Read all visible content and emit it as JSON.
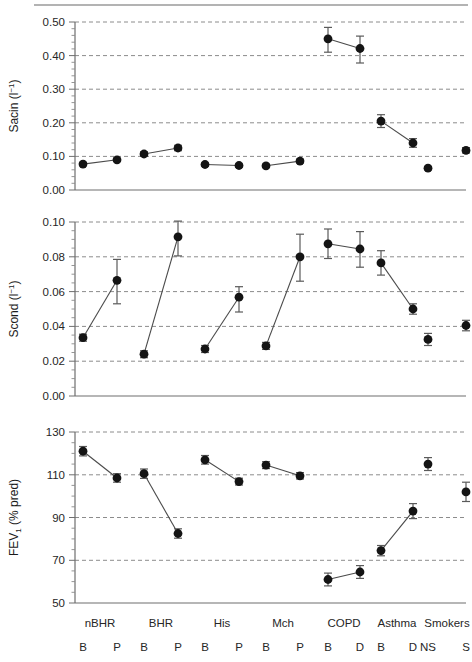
{
  "figure": {
    "background": "#ffffff",
    "marker_color": "#141414",
    "grid_color": "#8c8c8c",
    "axis_color": "#6e6e6e"
  },
  "groups": [
    {
      "label": "nBHR",
      "sub": [
        "B",
        "P"
      ],
      "connected": true
    },
    {
      "label": "BHR",
      "sub": [
        "B",
        "P"
      ],
      "connected": true
    },
    {
      "label": "His",
      "sub": [
        "B",
        "P"
      ],
      "connected": true
    },
    {
      "label": "Mch",
      "sub": [
        "B",
        "P"
      ],
      "connected": true
    },
    {
      "label": "COPD",
      "sub": [
        "B",
        "D"
      ],
      "connected": true
    },
    {
      "label": "Asthma",
      "sub": [
        "B",
        "D"
      ],
      "connected": true
    },
    {
      "label": "Smokers",
      "sub": [
        "NS",
        "S"
      ],
      "connected": false
    }
  ],
  "chart_data": [
    {
      "type": "scatter",
      "panel": "top",
      "title": "",
      "ylabel": "Sacin (l−1)",
      "xlabel": "",
      "ylim": [
        0.0,
        0.5
      ],
      "yticks": [
        0.0,
        0.1,
        0.2,
        0.3,
        0.4,
        0.5
      ],
      "ytick_labels": [
        "0.00",
        "0.10",
        "0.20",
        "0.30",
        "0.40",
        "0.50"
      ],
      "minor_tick_step": 0.02,
      "grid": true,
      "legend": "none",
      "categories": [
        "nBHR B",
        "nBHR P",
        "BHR B",
        "BHR P",
        "His B",
        "His P",
        "Mch B",
        "Mch P",
        "COPD B",
        "COPD D",
        "Asthma B",
        "Asthma D",
        "Smokers NS",
        "Smokers S"
      ],
      "values": [
        0.077,
        0.09,
        0.107,
        0.125,
        0.076,
        0.073,
        0.072,
        0.086,
        0.45,
        0.421,
        0.205,
        0.14,
        0.065,
        0.118
      ],
      "err_low": [
        0.005,
        0.005,
        0.007,
        0.008,
        0.005,
        0.005,
        0.005,
        0.006,
        0.04,
        0.043,
        0.019,
        0.013,
        0.005,
        0.008
      ],
      "err_high": [
        0.005,
        0.005,
        0.007,
        0.008,
        0.005,
        0.005,
        0.005,
        0.006,
        0.034,
        0.037,
        0.019,
        0.013,
        0.005,
        0.008
      ]
    },
    {
      "type": "scatter",
      "panel": "middle",
      "title": "",
      "ylabel": "Scond (l−1)",
      "xlabel": "",
      "ylim": [
        0.0,
        0.1
      ],
      "yticks": [
        0.0,
        0.02,
        0.04,
        0.06,
        0.08,
        0.1
      ],
      "ytick_labels": [
        "0.00",
        "0.02",
        "0.04",
        "0.06",
        "0.08",
        "0.10"
      ],
      "minor_tick_step": 0.005,
      "grid": true,
      "legend": "none",
      "categories": [
        "nBHR B",
        "nBHR P",
        "BHR B",
        "BHR P",
        "His B",
        "His P",
        "Mch B",
        "Mch P",
        "COPD B",
        "COPD D",
        "Asthma B",
        "Asthma D",
        "Smokers NS",
        "Smokers S"
      ],
      "values": [
        0.0335,
        0.0665,
        0.024,
        0.0915,
        0.027,
        0.0568,
        0.0288,
        0.08,
        0.0875,
        0.0845,
        0.0765,
        0.05,
        0.0325,
        0.0405
      ],
      "err_low": [
        0.002,
        0.0135,
        0.002,
        0.011,
        0.002,
        0.0085,
        0.002,
        0.014,
        0.0085,
        0.0105,
        0.007,
        0.003,
        0.0035,
        0.003
      ],
      "err_high": [
        0.002,
        0.012,
        0.002,
        0.009,
        0.002,
        0.006,
        0.002,
        0.013,
        0.0085,
        0.01,
        0.007,
        0.003,
        0.0035,
        0.003
      ]
    },
    {
      "type": "scatter",
      "panel": "bottom",
      "title": "",
      "ylabel": "FEV1 (% pred)",
      "ylabel_main": "FEV",
      "ylabel_sub": "1",
      "ylabel_tail": " (% pred)",
      "xlabel": "",
      "ylim": [
        50,
        130
      ],
      "yticks": [
        50,
        70,
        90,
        110,
        130
      ],
      "ytick_labels": [
        "50",
        "70",
        "90",
        "110",
        "130"
      ],
      "minor_tick_step": 5,
      "grid": true,
      "legend": "none",
      "categories": [
        "nBHR B",
        "nBHR P",
        "BHR B",
        "BHR P",
        "His B",
        "His P",
        "Mch B",
        "Mch P",
        "COPD B",
        "COPD D",
        "Asthma B",
        "Asthma D",
        "Smokers NS",
        "Smokers S"
      ],
      "values": [
        121.0,
        108.5,
        110.5,
        82.5,
        117.0,
        106.8,
        114.5,
        109.5,
        61.0,
        64.5,
        74.5,
        93.0,
        115.0,
        102.0
      ],
      "err_low": [
        2.2,
        2.0,
        2.2,
        2.2,
        2.0,
        1.6,
        1.6,
        1.5,
        3.0,
        3.0,
        2.4,
        3.5,
        3.0,
        4.5
      ],
      "err_high": [
        2.2,
        2.0,
        2.2,
        2.2,
        2.0,
        1.6,
        1.6,
        1.5,
        3.0,
        3.0,
        2.4,
        3.5,
        3.0,
        4.5
      ]
    }
  ]
}
